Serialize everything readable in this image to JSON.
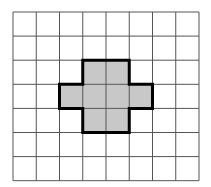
{
  "grid": {
    "columns": 8,
    "rows": 7,
    "origin_x": 13,
    "origin_y": 12,
    "cell_width": 23.25,
    "cell_height": 24.1,
    "line_color": "#555555",
    "line_width": 1,
    "background": "#ffffff"
  },
  "shape": {
    "description": "Plus-shaped figure of 8 shaded unit squares",
    "fill_color": "#c8c8c8",
    "outline_color": "#000000",
    "outline_width": 3,
    "cells": [
      [
        2,
        3
      ],
      [
        2,
        4
      ],
      [
        3,
        2
      ],
      [
        3,
        3
      ],
      [
        3,
        4
      ],
      [
        3,
        5
      ],
      [
        4,
        3
      ],
      [
        4,
        4
      ]
    ],
    "area_units": 8
  }
}
